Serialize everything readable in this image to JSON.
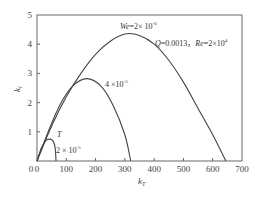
{
  "chart_data": {
    "type": "line",
    "title": "",
    "xlabel": "k_T",
    "ylabel": "k_i",
    "xlim": [
      0,
      700
    ],
    "ylim": [
      0,
      5
    ],
    "x_ticks": [
      0,
      100,
      200,
      300,
      400,
      500,
      600,
      700
    ],
    "y_ticks": [
      0,
      1,
      2,
      3,
      4,
      5
    ],
    "grid": false,
    "legend": "none",
    "annotations": {
      "params": "Q=0.0013，Re=2×10⁴",
      "curve_labels": [
        "We=2×10⁻⁶",
        "4×10⁻⁵",
        "T",
        "2×10⁻⁵"
      ]
    },
    "series": [
      {
        "name": "We=2×10⁻⁶",
        "x": [
          0,
          50,
          100,
          150,
          200,
          250,
          300,
          350,
          400,
          450,
          500,
          550,
          600,
          645
        ],
        "y": [
          0,
          1.2,
          2.2,
          3.0,
          3.65,
          4.1,
          4.35,
          4.3,
          4.0,
          3.45,
          2.7,
          1.8,
          0.9,
          0
        ]
      },
      {
        "name": "4×10⁻⁵",
        "x": [
          0,
          40,
          80,
          120,
          170,
          220,
          260,
          300,
          320
        ],
        "y": [
          0,
          1.05,
          1.95,
          2.55,
          2.82,
          2.55,
          1.9,
          0.9,
          0
        ]
      },
      {
        "name": "2×10⁻⁵",
        "x": [
          0,
          15,
          30,
          45,
          55,
          62,
          65
        ],
        "y": [
          0,
          0.45,
          0.7,
          0.75,
          0.68,
          0.45,
          0
        ]
      }
    ]
  },
  "axis": {
    "x_tick_labels": [
      "0",
      "100",
      "200",
      "300",
      "400",
      "500",
      "600",
      "700"
    ],
    "y_tick_labels": [
      "0",
      "1",
      "2",
      "3",
      "4",
      "5"
    ],
    "xlabel_main": "k",
    "xlabel_sub": "T",
    "ylabel_main": "k",
    "ylabel_sub": "i"
  },
  "labels": {
    "we_prefix": "We",
    "we_value": "=2× 10",
    "we_exp": "-6",
    "q_label": "Q",
    "q_value": "=0.0013，",
    "re_label": "Re",
    "re_value": "=2×10",
    "re_exp": "4",
    "mid_value": "4 ×10",
    "mid_exp": "-5",
    "t_label": "T",
    "low_value": "2 × 10",
    "low_exp": "-5"
  },
  "colors": {
    "axis": "#555555",
    "curve": "#444444"
  }
}
